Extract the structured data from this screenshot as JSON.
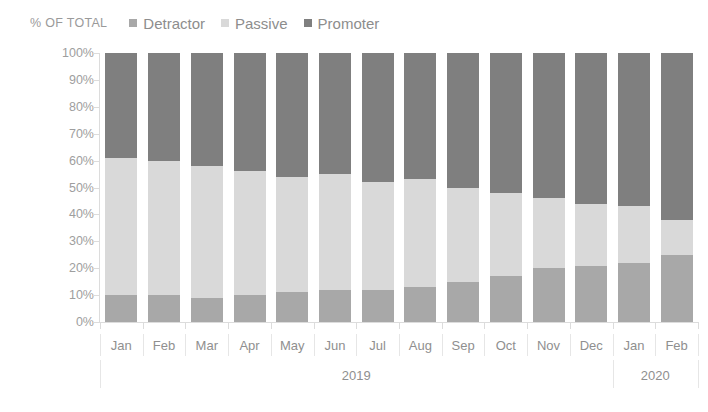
{
  "axis_title": "% OF TOTAL",
  "legend": {
    "position": "top",
    "items": [
      {
        "label": "Detractor",
        "color": "#a8a8a8"
      },
      {
        "label": "Passive",
        "color": "#d9d9d9"
      },
      {
        "label": "Promoter",
        "color": "#7f7f7f"
      }
    ]
  },
  "colors": {
    "detractor": "#a8a8a8",
    "passive": "#d9d9d9",
    "promoter": "#7f7f7f",
    "axis": "#dcdcdc",
    "text": "#9a9a9a",
    "background": "#ffffff"
  },
  "y_axis": {
    "ticks": [
      "0%",
      "10%",
      "20%",
      "30%",
      "40%",
      "50%",
      "60%",
      "70%",
      "80%",
      "90%",
      "100%"
    ],
    "min": 0,
    "max": 100
  },
  "year_groups": [
    {
      "label": "2019",
      "count": 12
    },
    {
      "label": "2020",
      "count": 2
    }
  ],
  "chart_data": {
    "type": "bar",
    "stacked": true,
    "title": "",
    "subtitle": "",
    "xlabel": "",
    "ylabel": "% OF TOTAL",
    "ylim": [
      0,
      100
    ],
    "grid": false,
    "legend_position": "top",
    "categories": [
      "Jan",
      "Feb",
      "Mar",
      "Apr",
      "May",
      "Jun",
      "Jul",
      "Aug",
      "Sep",
      "Oct",
      "Nov",
      "Dec",
      "Jan",
      "Feb"
    ],
    "category_years": [
      "2019",
      "2019",
      "2019",
      "2019",
      "2019",
      "2019",
      "2019",
      "2019",
      "2019",
      "2019",
      "2019",
      "2019",
      "2020",
      "2020"
    ],
    "series": [
      {
        "name": "Detractor",
        "color": "#a8a8a8",
        "values": [
          10,
          10,
          9,
          10,
          11,
          12,
          12,
          13,
          15,
          17,
          20,
          21,
          22,
          25
        ]
      },
      {
        "name": "Passive",
        "color": "#d9d9d9",
        "values": [
          51,
          50,
          49,
          46,
          43,
          43,
          40,
          40,
          35,
          31,
          26,
          23,
          21,
          13
        ]
      },
      {
        "name": "Promoter",
        "color": "#7f7f7f",
        "values": [
          39,
          40,
          42,
          44,
          46,
          45,
          48,
          47,
          50,
          52,
          54,
          56,
          57,
          62
        ]
      }
    ],
    "cumulative_tops": {
      "detractor": [
        10,
        10,
        9,
        10,
        11,
        12,
        12,
        13,
        15,
        17,
        20,
        21,
        22,
        25
      ],
      "passive": [
        61,
        60,
        58,
        56,
        54,
        55,
        52,
        53,
        50,
        48,
        46,
        44,
        43,
        38
      ]
    }
  }
}
